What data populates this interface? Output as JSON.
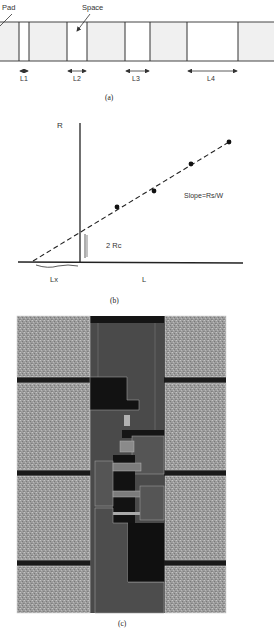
{
  "panel_a": {
    "pad_label": "Pad",
    "space_label": "Space",
    "spacing_labels": [
      "L1",
      "L2",
      "L3",
      "L4"
    ],
    "caption": "(a)"
  },
  "panel_b": {
    "y_axis_label": "R",
    "x_axis_label": "L",
    "intercept_label": "2 Rc",
    "x_intercept_label": "Lx",
    "slope_label": "Slope=Rs/W",
    "caption": "(b)",
    "point_count": 4
  },
  "panel_c": {
    "caption": "(c)"
  },
  "colors": {
    "pad_fill": "#f0f0f0",
    "line": "#333333",
    "layout_pad": "#9a9a9a",
    "layout_center": "#4a4a4a",
    "layout_dark": "#111111",
    "layout_outline": "#c8c8c8"
  }
}
